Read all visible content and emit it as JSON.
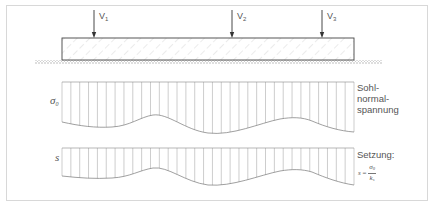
{
  "diagram": {
    "loads": [
      {
        "label": "V",
        "sub": "1",
        "x": 94
      },
      {
        "label": "V",
        "sub": "2",
        "x": 232
      },
      {
        "label": "V",
        "sub": "3",
        "x": 322
      }
    ],
    "stress_diagram": {
      "axis_label": "σ",
      "axis_label_sub": "0",
      "caption_lines": [
        "Sohl-",
        "normal-",
        "spannung"
      ]
    },
    "settlement_diagram": {
      "axis_label": "s",
      "caption": "Setzung:",
      "formula": {
        "lhs": "s",
        "equals": "=",
        "numerator": "σ",
        "numerator_sub": "0",
        "denominator": "k",
        "denominator_sub": "s"
      }
    },
    "colors": {
      "frame": "#d8d8d8",
      "line": "#555555",
      "hatch": "#bdbdbd",
      "text": "#555555"
    }
  }
}
